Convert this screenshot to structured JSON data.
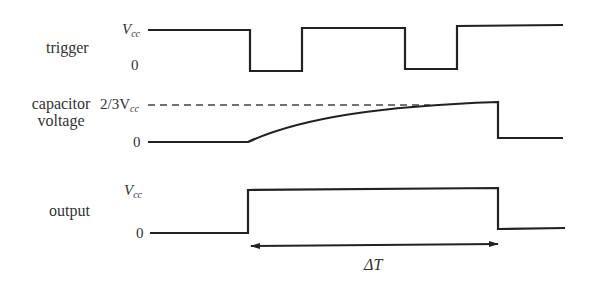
{
  "diagram": {
    "rows": [
      {
        "name": "trigger",
        "label": "trigger",
        "high_label": "V",
        "high_sub": "cc",
        "low_label": "0"
      },
      {
        "name": "capacitor",
        "label_line1": "capacitor",
        "label_line2": "voltage",
        "threshold_label": "2/3V",
        "threshold_sub": "cc",
        "low_label": "0"
      },
      {
        "name": "output",
        "label": "output",
        "high_label": "V",
        "high_sub": "cc",
        "low_label": "0"
      }
    ],
    "interval": {
      "label": "ΔT"
    },
    "colors": {
      "line": "#222222",
      "dashed": "#444444",
      "text": "#333333",
      "background": "#ffffff"
    }
  }
}
